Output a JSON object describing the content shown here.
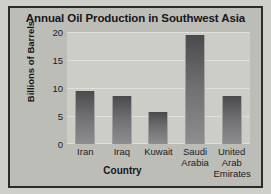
{
  "chart_data": {
    "type": "bar",
    "title": "Annual Oil Production in Southwest Asia",
    "xlabel": "Country",
    "ylabel": "Billions of Barrels",
    "categories": [
      "Iran",
      "Iraq",
      "Kuwait",
      "Saudi Arabia",
      "United Arab Emirates"
    ],
    "category_lines": [
      [
        "Iran"
      ],
      [
        "Iraq"
      ],
      [
        "Kuwait"
      ],
      [
        "Saudi",
        "Arabia"
      ],
      [
        "United",
        "Arab",
        "Emirates"
      ]
    ],
    "values": [
      9.5,
      8.6,
      5.8,
      19.5,
      8.5
    ],
    "ylim": [
      0,
      20
    ],
    "yticks": [
      20,
      15,
      10,
      5,
      0
    ],
    "grid": true,
    "legend": "none",
    "colors": {
      "bar_top": "#4a4a4c",
      "bar_bottom": "#8e8e90",
      "plot_background": "#cdcdc8",
      "chart_background": "#bdbdb8",
      "frame_border": "#2b2b2b",
      "gridline": "#e0e0dc",
      "text": "#17171a"
    }
  }
}
